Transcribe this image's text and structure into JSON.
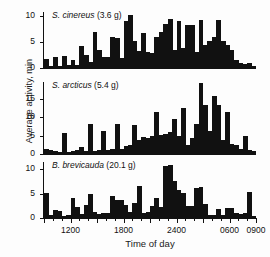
{
  "figure": {
    "background": "#fdfdfd",
    "ink_color": "#111111",
    "ylabel": "Average activity, min",
    "xlabel": "Time of day"
  },
  "axis": {
    "x_tick_labels": [
      "1200",
      "1800",
      "2400",
      "0600",
      "0900"
    ],
    "x_tick_values": [
      1200,
      1800,
      2400,
      3000,
      3300
    ],
    "x_range_label_start": "0900",
    "x_major_step": 600,
    "x_minor_step": 100
  },
  "panels": [
    {
      "id": "panel-cinereus",
      "species": "S. cinereus",
      "mass": "(3.6 g)",
      "label": "S. cinereus (3.6 g)",
      "y_ticks": [
        0,
        5,
        10
      ],
      "ylim": [
        0,
        10.8
      ]
    },
    {
      "id": "panel-arcticus",
      "species": "S. arcticus",
      "mass": "(5.4 g)",
      "label": "S. arcticus (5.4 g)",
      "y_ticks": [
        0,
        5,
        10,
        15
      ],
      "ylim": [
        0,
        19.5
      ]
    },
    {
      "id": "panel-brevicauda",
      "species": "B. brevicauda",
      "mass": "(20.1 g)",
      "label": "B. brevicauda (20.1 g)",
      "y_ticks": [
        0,
        5,
        10
      ],
      "ylim": [
        0,
        11.5
      ]
    }
  ],
  "chart_data": {
    "type": "bar",
    "title": "",
    "xlabel": "Time of day",
    "ylabel": "Average activity, min",
    "grid": false,
    "legend": false,
    "x_axis": {
      "label": "Time of day",
      "tick_labels": [
        "1200",
        "1800",
        "2400",
        "0600",
        "0900"
      ],
      "tick_values": [
        1200,
        1800,
        2400,
        3000,
        3300
      ],
      "range_clock": [
        "0900",
        "0900"
      ],
      "bin_minutes": 30,
      "n_bins": 48
    },
    "panels": [
      {
        "name": "S. cinereus (3.6 g)",
        "ylabel": "Average activity, min",
        "ylim": [
          0,
          10.8
        ],
        "yticks": [
          0,
          5,
          10
        ],
        "values": [
          1.8,
          0.3,
          2.1,
          0.4,
          2.4,
          0.5,
          1.6,
          0.6,
          4.3,
          2.6,
          1.1,
          7.0,
          3.5,
          2.2,
          2.1,
          6.0,
          5.8,
          1.9,
          9.0,
          10.2,
          5.3,
          3.2,
          6.8,
          3.0,
          2.9,
          6.0,
          7.0,
          8.5,
          9.5,
          3.4,
          9.0,
          3.9,
          8.2,
          8.3,
          3.0,
          9.2,
          4.4,
          5.2,
          6.0,
          9.3,
          5.2,
          4.4,
          3.4,
          1.6,
          1.0,
          0.8,
          0.9,
          0.4
        ]
      },
      {
        "name": "S. arcticus (5.4 g)",
        "ylabel": "Average activity, min",
        "ylim": [
          0,
          19.5
        ],
        "yticks": [
          0,
          5,
          10,
          15
        ],
        "values": [
          1.3,
          1.2,
          0.9,
          0.6,
          5.6,
          0.6,
          0.9,
          1.1,
          1.9,
          0.8,
          8.1,
          0.8,
          1.0,
          6.3,
          1.2,
          1.4,
          8.1,
          1.4,
          2.3,
          2.5,
          7.9,
          3.9,
          4.6,
          4.4,
          4.8,
          11.5,
          5.1,
          5.5,
          5.9,
          9.5,
          4.9,
          12.5,
          2.5,
          4.3,
          8.1,
          19.2,
          13.4,
          6.2,
          15.8,
          13.2,
          3.9,
          11.4,
          2.6,
          2.4,
          1.4,
          5.0,
          1.1,
          0.9
        ]
      },
      {
        "name": "B. brevicauda (20.1 g)",
        "ylabel": "Average activity, min",
        "ylim": [
          0,
          11.5
        ],
        "yticks": [
          0,
          5,
          10
        ],
        "values": [
          5.2,
          0.6,
          1.6,
          1.5,
          0.5,
          0.7,
          4.1,
          2.2,
          0.9,
          2.7,
          5.0,
          1.3,
          0.9,
          1.0,
          1.1,
          4.6,
          3.6,
          3.7,
          2.6,
          1.3,
          3.0,
          6.6,
          1.1,
          1.2,
          2.5,
          4.1,
          2.2,
          10.6,
          10.8,
          7.7,
          5.7,
          5.1,
          2.5,
          2.4,
          6.2,
          6.3,
          2.9,
          0.6,
          0.7,
          1.8,
          0.6,
          2.1,
          2.0,
          1.0,
          0.9,
          1.1,
          5.4,
          0.5
        ]
      }
    ]
  }
}
